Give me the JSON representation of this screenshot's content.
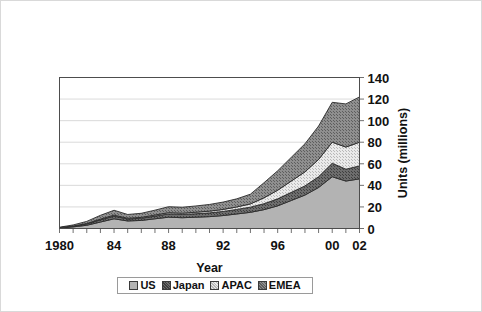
{
  "chart_data": {
    "type": "area",
    "stacked": true,
    "title": "",
    "xlabel": "Year",
    "ylabel": "Units (millions)",
    "ylim": [
      0,
      140
    ],
    "ytick_values": [
      0,
      20,
      40,
      60,
      80,
      100,
      120,
      140
    ],
    "ytick_labels": [
      "0",
      "20",
      "40",
      "60",
      "80",
      "100",
      "120",
      "140"
    ],
    "xlim": [
      1980,
      2002
    ],
    "x": [
      1980,
      1981,
      1982,
      1983,
      1984,
      1985,
      1986,
      1987,
      1988,
      1989,
      1990,
      1991,
      1992,
      1993,
      1994,
      1995,
      1996,
      1997,
      1998,
      1999,
      2000,
      2001,
      2002
    ],
    "xtick_values": [
      1980,
      1984,
      1988,
      1992,
      1996,
      2000,
      2002
    ],
    "xtick_labels": [
      "1980",
      "84",
      "88",
      "92",
      "96",
      "00",
      "02"
    ],
    "grid": "horizontal",
    "legend_position": "bottom",
    "series": [
      {
        "name": "US",
        "fill": "#b3b3b3",
        "pattern": "solid",
        "values": [
          0.5,
          1.5,
          3.0,
          6.0,
          9.0,
          7.0,
          7.5,
          9.0,
          10.5,
          10.0,
          10.5,
          11.0,
          12.0,
          13.5,
          15.0,
          17.5,
          21.0,
          26.0,
          31.0,
          38.0,
          48.0,
          44.0,
          46.0
        ]
      },
      {
        "name": "Japan",
        "fill": "#696969",
        "pattern": "dense-hatch",
        "values": [
          0.2,
          0.6,
          1.2,
          2.0,
          2.5,
          1.8,
          2.0,
          2.5,
          3.0,
          3.0,
          3.2,
          3.5,
          3.8,
          4.2,
          4.8,
          5.5,
          6.5,
          7.5,
          8.5,
          10.0,
          12.5,
          11.0,
          12.0
        ]
      },
      {
        "name": "APAC",
        "fill": "#e2e2e2",
        "pattern": "fine-check",
        "values": [
          0.1,
          0.2,
          0.4,
          0.7,
          0.9,
          0.7,
          0.8,
          1.0,
          1.2,
          1.2,
          1.4,
          1.6,
          1.9,
          2.3,
          3.0,
          5.5,
          8.0,
          10.5,
          13.0,
          16.0,
          19.5,
          20.5,
          22.0
        ]
      },
      {
        "name": "EMEA",
        "fill": "#8a8a8a",
        "pattern": "coarse-check",
        "values": [
          0.4,
          1.0,
          2.0,
          3.5,
          4.5,
          3.5,
          3.8,
          4.5,
          5.5,
          5.5,
          5.8,
          6.2,
          6.8,
          7.5,
          9.0,
          14.0,
          18.0,
          22.0,
          26.0,
          31.0,
          37.0,
          40.0,
          42.0
        ]
      }
    ],
    "totals": [
      1.2,
      3.3,
      6.6,
      12.2,
      16.9,
      13.0,
      14.1,
      17.0,
      20.2,
      19.7,
      20.9,
      22.3,
      24.5,
      27.5,
      31.8,
      42.5,
      53.5,
      66.0,
      78.5,
      95.0,
      117.0,
      115.5,
      122.0
    ]
  },
  "legend": {
    "items": [
      {
        "label": "US"
      },
      {
        "label": "Japan"
      },
      {
        "label": "APAC"
      },
      {
        "label": "EMEA"
      }
    ]
  }
}
